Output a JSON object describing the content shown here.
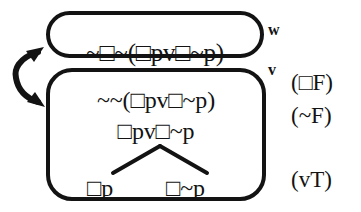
{
  "figure": {
    "type": "modal-logic-tableau",
    "background_color": "#ffffff",
    "ink_color": "#131313"
  },
  "worlds": [
    {
      "id": "w",
      "label": "w",
      "formulas": [
        "~□~(□pv□~p)"
      ]
    },
    {
      "id": "v",
      "label": "v",
      "formulas": [
        "~~(□pv□~p)",
        "□pv□~p"
      ],
      "branches": [
        "□p",
        "□~p"
      ]
    }
  ],
  "annotations": [
    "(□F)",
    "(~F)",
    "(vT)"
  ],
  "accessibility_relation": {
    "name": "double-headed-curved-arrow",
    "from": "w",
    "to": "v",
    "bidirectional": true
  }
}
